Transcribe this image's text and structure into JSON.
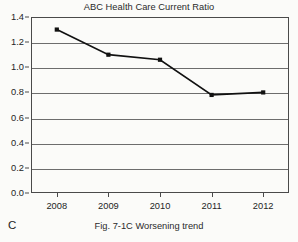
{
  "figure": {
    "panel_letter": "C",
    "caption": "Fig. 7-1C Worsening trend",
    "title": "ABC Health Care Current Ratio"
  },
  "colors": {
    "background": "#fbfbf9",
    "line": "#111111",
    "marker": "#111111",
    "gridline": "#6d6d6d",
    "axis": "#4a4a4a",
    "text": "#242424"
  },
  "chart_data": {
    "type": "line",
    "title": "ABC Health Care Current Ratio",
    "xlabel": "",
    "ylabel": "",
    "categories": [
      "2008",
      "2009",
      "2010",
      "2011",
      "2012"
    ],
    "values": [
      1.3,
      1.1,
      1.06,
      0.78,
      0.8
    ],
    "series": [
      {
        "name": "Current Ratio",
        "values": [
          1.3,
          1.1,
          1.06,
          0.78,
          0.8
        ]
      }
    ],
    "ylim": [
      0.0,
      1.4
    ],
    "yticks": [
      0.0,
      0.2,
      0.4,
      0.6,
      0.8,
      1.0,
      1.2,
      1.4
    ],
    "ytick_labels": [
      "0.0",
      "0.2",
      "0.4",
      "0.6",
      "0.8",
      "1.0",
      "1.2",
      "1.4"
    ],
    "xtick_labels": [
      "2008",
      "2009",
      "2010",
      "2011",
      "2012"
    ],
    "grid": true,
    "grid_axis": "y",
    "legend": false,
    "legend_position": "none",
    "marker": "square",
    "annotations": []
  }
}
